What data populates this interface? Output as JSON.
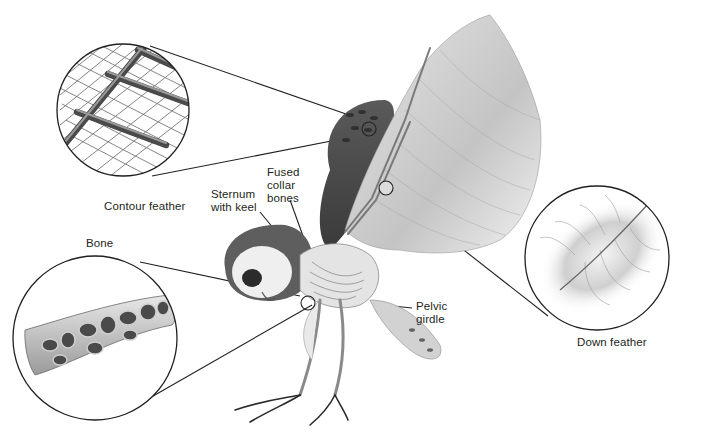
{
  "diagram": {
    "labels": {
      "contour_feather": "Contour feather",
      "sternum": "Sternum\nwith keel",
      "collar_bones": "Fused\ncollar\nbones",
      "pelvic_girdle": "Pelvic\ngirdle",
      "down_feather": "Down feather",
      "bone": "Bone"
    },
    "colors": {
      "background": "#ffffff",
      "line": "#231f20",
      "feather_dark": "#4a4a4a",
      "feather_mid": "#8c8c8c",
      "feather_light": "#d9d9d9"
    }
  }
}
